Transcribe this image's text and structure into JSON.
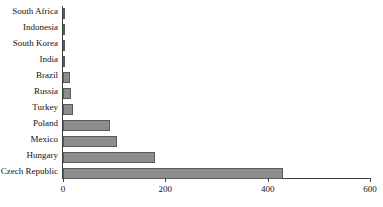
{
  "chart_data": {
    "type": "bar",
    "orientation": "horizontal",
    "title": "",
    "subtitle": "",
    "xlabel": "",
    "ylabel": "",
    "categories": [
      "South Africa",
      "Indonesia",
      "South Korea",
      "India",
      "Brazil",
      "Russia",
      "Turkey",
      "Poland",
      "Mexico",
      "Hungary",
      "Czech Republic"
    ],
    "values": [
      1,
      3,
      3,
      3,
      14,
      15,
      20,
      92,
      105,
      180,
      430
    ],
    "xlim": [
      0,
      600
    ],
    "xticks": [
      0,
      200,
      400,
      600
    ],
    "xtick_labels": [
      "0",
      "200",
      "400",
      "600"
    ],
    "grid": false,
    "legend": null,
    "bar_color": "#8d8d8d",
    "bar_edge_color": "#5a5a5a",
    "axis_color": "#404040",
    "background": "#ffffff"
  }
}
